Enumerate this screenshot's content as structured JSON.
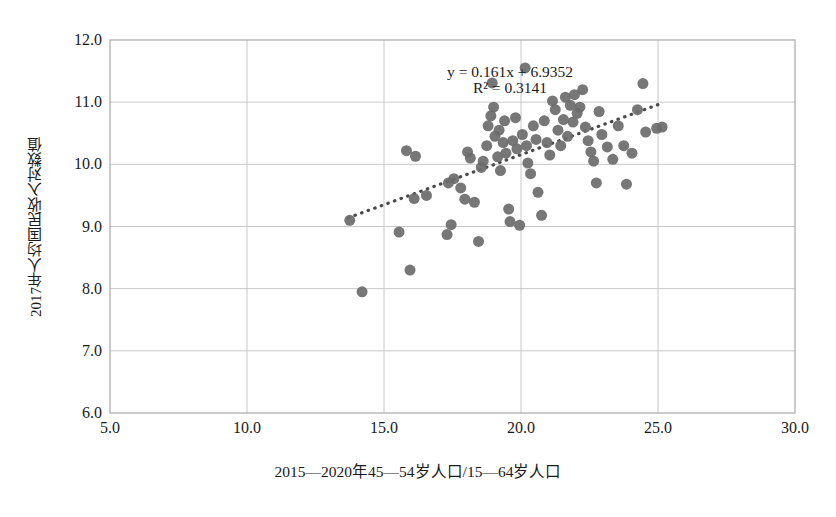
{
  "chart_data": {
    "type": "scatter",
    "title": "",
    "xlabel": "2015—2020年45—54岁人口/15—64岁人口",
    "ylabel": "2017年人均国民收入对数值",
    "xlim": [
      5.0,
      30.0
    ],
    "ylim": [
      6.0,
      12.0
    ],
    "xticks": [
      "5.0",
      "10.0",
      "15.0",
      "20.0",
      "25.0",
      "30.0"
    ],
    "yticks": [
      "6.0",
      "7.0",
      "8.0",
      "9.0",
      "10.0",
      "11.0",
      "12.0"
    ],
    "xtick_values": [
      5,
      10,
      15,
      20,
      25,
      30
    ],
    "ytick_values": [
      6,
      7,
      8,
      9,
      10,
      11,
      12
    ],
    "grid": true,
    "legend": "none",
    "marker_color": "#6b6b6b",
    "marker_size": 11,
    "annotations": [
      {
        "text": "y = 0.161x + 6.9352",
        "x": 19.6,
        "y": 11.48
      },
      {
        "text": "R² = 0.3141",
        "x": 19.6,
        "y": 11.22
      }
    ],
    "trendline": {
      "style": "dotted",
      "color": "#4a4a4a",
      "slope": 0.161,
      "intercept": 6.9352,
      "r_squared": 0.3141,
      "x_start": 13.7,
      "x_end": 25.2
    },
    "points": [
      [
        14.2,
        7.95
      ],
      [
        13.75,
        9.1
      ],
      [
        15.55,
        8.91
      ],
      [
        15.95,
        8.3
      ],
      [
        15.82,
        10.22
      ],
      [
        16.15,
        10.13
      ],
      [
        16.1,
        9.45
      ],
      [
        16.55,
        9.5
      ],
      [
        17.3,
        8.87
      ],
      [
        17.45,
        9.03
      ],
      [
        17.35,
        9.7
      ],
      [
        17.55,
        9.77
      ],
      [
        17.8,
        9.62
      ],
      [
        17.95,
        9.44
      ],
      [
        18.05,
        10.2
      ],
      [
        18.15,
        10.1
      ],
      [
        18.3,
        9.39
      ],
      [
        18.45,
        8.76
      ],
      [
        18.55,
        9.95
      ],
      [
        18.62,
        10.05
      ],
      [
        18.75,
        10.3
      ],
      [
        18.8,
        10.62
      ],
      [
        18.9,
        10.78
      ],
      [
        18.95,
        11.31
      ],
      [
        19.0,
        10.92
      ],
      [
        19.05,
        10.45
      ],
      [
        19.15,
        10.12
      ],
      [
        19.2,
        10.55
      ],
      [
        19.25,
        9.9
      ],
      [
        19.35,
        10.35
      ],
      [
        19.4,
        10.7
      ],
      [
        19.45,
        10.18
      ],
      [
        19.55,
        9.28
      ],
      [
        19.6,
        9.08
      ],
      [
        19.7,
        10.38
      ],
      [
        19.8,
        10.75
      ],
      [
        19.85,
        10.25
      ],
      [
        19.95,
        9.02
      ],
      [
        20.05,
        10.48
      ],
      [
        20.15,
        11.55
      ],
      [
        20.2,
        10.3
      ],
      [
        20.25,
        10.02
      ],
      [
        20.35,
        9.85
      ],
      [
        20.45,
        10.62
      ],
      [
        20.55,
        10.4
      ],
      [
        20.62,
        9.55
      ],
      [
        20.75,
        9.18
      ],
      [
        20.85,
        10.7
      ],
      [
        20.95,
        10.35
      ],
      [
        21.05,
        10.15
      ],
      [
        21.15,
        11.02
      ],
      [
        21.25,
        10.88
      ],
      [
        21.35,
        10.55
      ],
      [
        21.45,
        10.3
      ],
      [
        21.55,
        10.72
      ],
      [
        21.62,
        11.08
      ],
      [
        21.7,
        10.45
      ],
      [
        21.8,
        10.95
      ],
      [
        21.9,
        10.68
      ],
      [
        21.95,
        11.12
      ],
      [
        22.05,
        10.82
      ],
      [
        22.15,
        10.92
      ],
      [
        22.25,
        11.2
      ],
      [
        22.35,
        10.6
      ],
      [
        22.45,
        10.38
      ],
      [
        22.55,
        10.2
      ],
      [
        22.65,
        10.05
      ],
      [
        22.75,
        9.7
      ],
      [
        22.85,
        10.85
      ],
      [
        22.95,
        10.48
      ],
      [
        23.15,
        10.28
      ],
      [
        23.35,
        10.08
      ],
      [
        23.55,
        10.62
      ],
      [
        23.75,
        10.3
      ],
      [
        23.85,
        9.68
      ],
      [
        24.05,
        10.18
      ],
      [
        24.25,
        10.88
      ],
      [
        24.45,
        11.3
      ],
      [
        24.55,
        10.52
      ],
      [
        24.95,
        10.58
      ],
      [
        25.15,
        10.6
      ]
    ]
  }
}
